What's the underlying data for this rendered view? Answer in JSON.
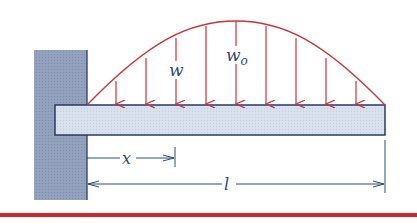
{
  "diagram": {
    "type": "cantilever-beam-distributed-load",
    "labels": {
      "load_local": "w",
      "load_peak": "w",
      "load_peak_subscript": "o",
      "position": "x",
      "length": "l"
    },
    "colors": {
      "load": "#c8323c",
      "beam_fill": "#d6deea",
      "beam_stroke": "#2a3a66",
      "wall_fill": "#8d9bb8",
      "dimension": "#2f4a7a",
      "rule": "#d0262d"
    },
    "arrow_count": 9
  }
}
